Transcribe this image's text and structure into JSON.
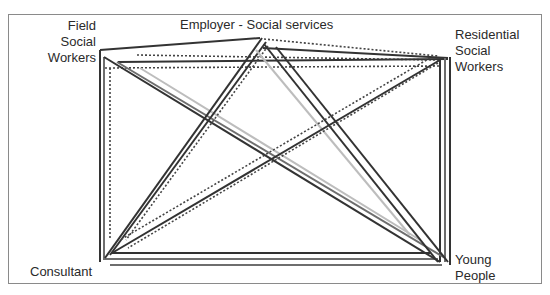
{
  "diagram": {
    "nodes": [
      {
        "id": "employer",
        "label": "Employer - Social services",
        "x": 262,
        "y": 38
      },
      {
        "id": "field",
        "label": "Field\nSocial\nWorkers",
        "x": 100,
        "y": 55
      },
      {
        "id": "residential",
        "label": "Residential\nSocial\nWorkers",
        "x": 448,
        "y": 60
      },
      {
        "id": "consultant",
        "label": "Consultant",
        "x": 103,
        "y": 262
      },
      {
        "id": "young",
        "label": "Young\nPeople",
        "x": 448,
        "y": 263
      }
    ],
    "labels": {
      "employer": "Employer - Social services",
      "field_line1": "Field",
      "field_line2": "Social",
      "field_line3": "Workers",
      "residential_line1": "Residential",
      "residential_line2": "Social",
      "residential_line3": "Workers",
      "consultant": "Consultant",
      "young_line1": "Young",
      "young_line2": "People"
    },
    "line_styles": {
      "dark": "#333333",
      "mid": "#6e6e6e",
      "light": "#bdbdbd",
      "dotted": "#444444"
    },
    "lines": [
      {
        "x1": 100,
        "y1": 50,
        "x2": 260,
        "y2": 38,
        "style": "dark"
      },
      {
        "x1": 264,
        "y1": 39,
        "x2": 438,
        "y2": 56,
        "style": "dotted"
      },
      {
        "x1": 137,
        "y1": 55,
        "x2": 440,
        "y2": 60,
        "style": "dotted"
      },
      {
        "x1": 118,
        "y1": 62,
        "x2": 448,
        "y2": 59,
        "style": "dark"
      },
      {
        "x1": 105,
        "y1": 68,
        "x2": 440,
        "y2": 66,
        "style": "dotted"
      },
      {
        "x1": 263,
        "y1": 48,
        "x2": 448,
        "y2": 58,
        "style": "dark"
      },
      {
        "x1": 100,
        "y1": 50,
        "x2": 100,
        "y2": 262,
        "style": "dark"
      },
      {
        "x1": 104,
        "y1": 57,
        "x2": 104,
        "y2": 260,
        "style": "mid"
      },
      {
        "x1": 110,
        "y1": 68,
        "x2": 110,
        "y2": 240,
        "style": "dotted"
      },
      {
        "x1": 440,
        "y1": 60,
        "x2": 440,
        "y2": 262,
        "style": "dark"
      },
      {
        "x1": 445,
        "y1": 58,
        "x2": 445,
        "y2": 262,
        "style": "mid"
      },
      {
        "x1": 450,
        "y1": 57,
        "x2": 450,
        "y2": 265,
        "style": "dark"
      },
      {
        "x1": 112,
        "y1": 253,
        "x2": 430,
        "y2": 253,
        "style": "dark"
      },
      {
        "x1": 105,
        "y1": 259,
        "x2": 438,
        "y2": 259,
        "style": "mid"
      },
      {
        "x1": 110,
        "y1": 265,
        "x2": 442,
        "y2": 265,
        "style": "mid"
      },
      {
        "x1": 104,
        "y1": 57,
        "x2": 440,
        "y2": 262,
        "style": "dark"
      },
      {
        "x1": 117,
        "y1": 62,
        "x2": 445,
        "y2": 258,
        "style": "mid"
      },
      {
        "x1": 140,
        "y1": 68,
        "x2": 420,
        "y2": 240,
        "style": "light"
      },
      {
        "x1": 262,
        "y1": 38,
        "x2": 105,
        "y2": 258,
        "style": "dark"
      },
      {
        "x1": 266,
        "y1": 42,
        "x2": 110,
        "y2": 255,
        "style": "dark"
      },
      {
        "x1": 268,
        "y1": 46,
        "x2": 126,
        "y2": 240,
        "style": "dotted"
      },
      {
        "x1": 264,
        "y1": 44,
        "x2": 438,
        "y2": 262,
        "style": "dark"
      },
      {
        "x1": 276,
        "y1": 47,
        "x2": 448,
        "y2": 262,
        "style": "dark"
      },
      {
        "x1": 256,
        "y1": 50,
        "x2": 410,
        "y2": 235,
        "style": "light"
      },
      {
        "x1": 440,
        "y1": 60,
        "x2": 112,
        "y2": 253,
        "style": "dark"
      },
      {
        "x1": 430,
        "y1": 58,
        "x2": 120,
        "y2": 240,
        "style": "dotted"
      },
      {
        "x1": 438,
        "y1": 63,
        "x2": 128,
        "y2": 248,
        "style": "dotted"
      }
    ]
  }
}
